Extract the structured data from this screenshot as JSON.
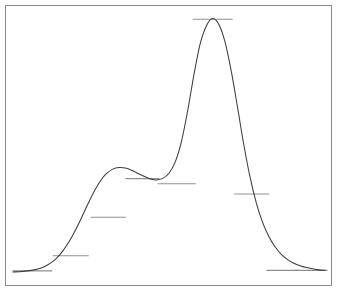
{
  "figure": {
    "title": "",
    "frame_color": "#8a8a8a",
    "curve_color": "#3c3c3c",
    "marker_color": "#8f8f8f",
    "background": "#ffffff"
  },
  "chart_data": {
    "type": "line",
    "title": "",
    "subtitle": "",
    "xlabel": "",
    "ylabel": "",
    "xlim": [
      0,
      100
    ],
    "ylim": [
      0,
      100
    ],
    "grid": false,
    "legend": false,
    "axis_ticks_visible": false,
    "axis_tick_labels": [],
    "annotations": [],
    "series": [
      {
        "name": "trace",
        "x": [
          0,
          2,
          4,
          6,
          8,
          10,
          12,
          14,
          16,
          18,
          20,
          22,
          24,
          26,
          28,
          30,
          32,
          34,
          36,
          38,
          40,
          42,
          44,
          46,
          48,
          50,
          52,
          54,
          56,
          58,
          60,
          62,
          64,
          66,
          68,
          70,
          72,
          74,
          76,
          78,
          80,
          82,
          84,
          86,
          88,
          90,
          92,
          94,
          96,
          98,
          100
        ],
        "y": [
          1.2,
          1.3,
          1.5,
          1.8,
          2.3,
          3.2,
          4.6,
          6.6,
          9.4,
          13.0,
          17.4,
          22.4,
          27.6,
          32.5,
          36.6,
          39.5,
          41.2,
          41.8,
          41.6,
          40.8,
          39.6,
          38.4,
          37.4,
          37.0,
          37.6,
          39.6,
          44.0,
          52.0,
          64.0,
          78.0,
          90.0,
          97.0,
          99.8,
          97.5,
          90.5,
          79.0,
          65.0,
          50.5,
          38.0,
          28.0,
          20.5,
          15.0,
          11.0,
          8.0,
          6.0,
          4.6,
          3.6,
          2.9,
          2.4,
          2.0,
          1.8
        ]
      }
    ],
    "markers": [
      {
        "id": "marker-baseline-left",
        "x_center": 6.2,
        "y": 1.6,
        "width": 40,
        "label": "baseline-left"
      },
      {
        "id": "marker-rise-low",
        "x_center": 18.5,
        "y": 7.5,
        "width": 36,
        "label": "rise-low"
      },
      {
        "id": "marker-rise-mid",
        "x_center": 30.5,
        "y": 22.5,
        "width": 35,
        "label": "rise-mid"
      },
      {
        "id": "marker-shoulder-top",
        "x_center": 41.5,
        "y": 37.5,
        "width": 34,
        "label": "shoulder-top"
      },
      {
        "id": "marker-valley",
        "x_center": 52.5,
        "y": 35.5,
        "width": 38,
        "label": "valley"
      },
      {
        "id": "marker-peak-apex",
        "x_center": 64.0,
        "y": 99.5,
        "width": 40,
        "label": "peak-apex"
      },
      {
        "id": "marker-fall-mid",
        "x_center": 76.5,
        "y": 31.5,
        "width": 35,
        "label": "fall-mid"
      },
      {
        "id": "marker-baseline-right-a",
        "x_center": 86.5,
        "y": 1.8,
        "width": 33,
        "label": "baseline-right-a"
      },
      {
        "id": "marker-baseline-right-b",
        "x_center": 95.5,
        "y": 1.8,
        "width": 33,
        "label": "baseline-right-b"
      }
    ]
  }
}
